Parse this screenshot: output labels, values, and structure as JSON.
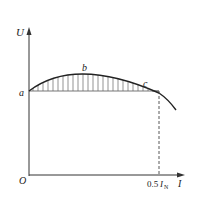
{
  "diagram": {
    "title": "",
    "axes": {
      "y_label": "U",
      "x_label": "I",
      "origin_label": "O"
    },
    "points": {
      "a": "a",
      "b": "b",
      "c": "c"
    },
    "x_tick": {
      "prefix": "0.5",
      "symbol": "I",
      "subscript": "N"
    }
  }
}
